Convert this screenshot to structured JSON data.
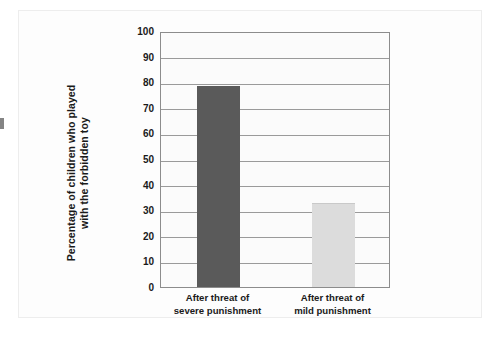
{
  "figure": {
    "background_color": "#fdfdfd",
    "plot_background_color": "#fbfbfb",
    "frame_color": "#8c8c8c",
    "gridline_color": "#9a9a9a",
    "text_color": "#1a1a1a"
  },
  "chart_data": {
    "type": "bar",
    "title": "",
    "subtitle": "",
    "xlabel": "",
    "ylabel": "Percentage of children who played with the forbidden toy",
    "ylabel_lines": [
      "Percentage of children who played",
      "with the forbidden toy"
    ],
    "categories": [
      "After threat of severe punishment",
      "After threat of mild punishment"
    ],
    "category_lines": [
      [
        "After threat of",
        "severe punishment"
      ],
      [
        "After threat of",
        "mild punishment"
      ]
    ],
    "values": [
      78,
      32.5
    ],
    "ylim": [
      0,
      100
    ],
    "ytick_values": [
      0,
      10,
      20,
      30,
      40,
      50,
      60,
      70,
      80,
      90,
      100
    ],
    "ytick_labels": [
      "0",
      "10",
      "20",
      "30",
      "40",
      "50",
      "60",
      "70",
      "80",
      "90",
      "100"
    ],
    "bar_colors": [
      "#5a5a5a",
      "#dcdcdc"
    ],
    "bar_edge_colors": [
      "#5a5a5a",
      "#c9c9c9"
    ],
    "grid": true,
    "grid_axis": "y",
    "legend": false,
    "legend_position": "none"
  }
}
